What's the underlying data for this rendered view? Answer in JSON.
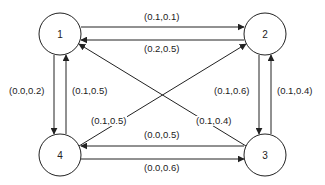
{
  "diagram": {
    "type": "directed-graph",
    "nodes": [
      {
        "id": "1",
        "label": "1",
        "cx": 60,
        "cy": 34
      },
      {
        "id": "2",
        "label": "2",
        "cx": 265,
        "cy": 34
      },
      {
        "id": "3",
        "label": "3",
        "cx": 265,
        "cy": 155
      },
      {
        "id": "4",
        "label": "4",
        "cx": 60,
        "cy": 155
      }
    ],
    "edges": [
      {
        "from": "1",
        "to": "2",
        "label": "(0.1,0.1)"
      },
      {
        "from": "2",
        "to": "1",
        "label": "(0.2,0.5)"
      },
      {
        "from": "1",
        "to": "4",
        "label": "(0.0,0.2)"
      },
      {
        "from": "4",
        "to": "1",
        "label": "(0.1,0.5)"
      },
      {
        "from": "2",
        "to": "3",
        "label": "(0.1,0.6)"
      },
      {
        "from": "3",
        "to": "2",
        "label": "(0.1,0.4)"
      },
      {
        "from": "4",
        "to": "2",
        "label": "(0.1,0.5)"
      },
      {
        "from": "3",
        "to": "1",
        "label": "(0.1,0.4)"
      },
      {
        "from": "3",
        "to": "4",
        "label": "(0.0,0.5)"
      },
      {
        "from": "4",
        "to": "3",
        "label": "(0.0,0.6)"
      }
    ],
    "colors": {
      "stroke": "#222222",
      "background": "#ffffff"
    }
  }
}
